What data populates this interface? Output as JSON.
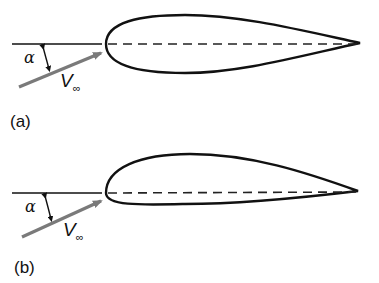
{
  "figure": {
    "panels": [
      {
        "id": "a",
        "label": "(a)",
        "description": "Symmetric airfoil at angle of attack",
        "alpha_symbol": "α",
        "velocity_symbol": "V",
        "velocity_subscript": "∞"
      },
      {
        "id": "b",
        "label": "(b)",
        "description": "Cambered airfoil at angle of attack",
        "alpha_symbol": "α",
        "velocity_symbol": "V",
        "velocity_subscript": "∞"
      }
    ],
    "colors": {
      "outline": "#111111",
      "arrow": "#7a7a7a",
      "chord": "#222222"
    }
  }
}
